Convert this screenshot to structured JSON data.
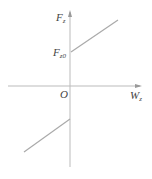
{
  "diagram": {
    "y_axis": {
      "label": "F",
      "subscript": "z"
    },
    "x_axis": {
      "label": "W",
      "subscript": "z"
    },
    "origin_label": "O",
    "intercept_label": {
      "label": "F",
      "subscript": "z0"
    },
    "line_color": "#aaaaaa",
    "axis_color": "#bbbbbb"
  }
}
